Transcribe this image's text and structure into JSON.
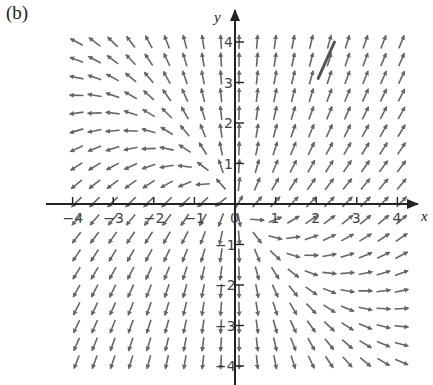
{
  "panel_label": "(b)",
  "chart_data": {
    "type": "vector_field",
    "title": "",
    "panel": "(b)",
    "xlabel": "x",
    "ylabel": "y",
    "xlim": [
      -4.2,
      4.2
    ],
    "ylim": [
      -4.3,
      4.4
    ],
    "x_ticks": [
      -4,
      -3,
      -2,
      -1,
      0,
      1,
      2,
      3,
      4
    ],
    "x_tick_labels": [
      "-4",
      "-3",
      "-2",
      "-1",
      "0",
      "1",
      "2",
      "3",
      "4"
    ],
    "y_ticks": [
      -4,
      -3,
      -2,
      -1,
      1,
      2,
      3,
      4
    ],
    "y_tick_labels": [
      "-4",
      "-3",
      "-2",
      "-1",
      "1",
      "2",
      "3",
      "4"
    ],
    "grid": false,
    "field": {
      "description": "approximate direction field: dx/dt = a*x, dy/dt = c*x + d*y",
      "a": 1,
      "c": 1,
      "d": 1.5
    },
    "sample_grid": {
      "x_start": -3.9,
      "x_end": 4.1,
      "nx": 19,
      "y_start": -3.9,
      "y_end": 4.0,
      "ny": 19
    },
    "arrow_length_units": 0.34,
    "arrow_color": "#666666",
    "axis_color": "#222222",
    "highlight_segment": {
      "description": "darker hand-drawn solution curve segment",
      "from": [
        2.05,
        3.1
      ],
      "to": [
        2.45,
        4.0
      ],
      "color": "#555555"
    }
  }
}
